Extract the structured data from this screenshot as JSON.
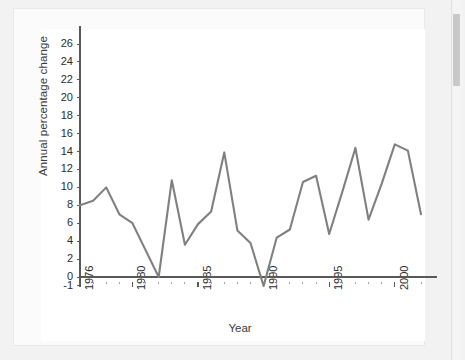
{
  "chart_data": {
    "type": "line",
    "title": "",
    "xlabel": "Year",
    "ylabel": "Annual percentage change",
    "xlim": [
      1976,
      2002
    ],
    "ylim": [
      -1,
      27
    ],
    "grid": false,
    "legend": "none",
    "line_color": "#808080",
    "axis_color": "#595959",
    "ytick_labels": [
      "26",
      "24",
      "22",
      "20",
      "18",
      "16",
      "14",
      "12",
      "10",
      "8",
      "6",
      "4",
      "2",
      "0",
      "-1"
    ],
    "ytick_values": [
      26,
      24,
      22,
      20,
      18,
      16,
      14,
      12,
      10,
      8,
      6,
      4,
      2,
      0,
      -1
    ],
    "xtick_labels": [
      "1976",
      "1980",
      "1985",
      "1990",
      "1995",
      "2000"
    ],
    "xtick_values": [
      1976,
      1980,
      1985,
      1990,
      1995,
      2000
    ],
    "x": [
      1976,
      1977,
      1978,
      1979,
      1980,
      1981,
      1982,
      1983,
      1984,
      1985,
      1986,
      1987,
      1988,
      1989,
      1990,
      1991,
      1992,
      1993,
      1994,
      1995,
      1996,
      1997,
      1998,
      1999,
      2000,
      2001,
      2002
    ],
    "values": [
      8.0,
      8.5,
      10.0,
      7.0,
      6.0,
      3.0,
      0.0,
      10.8,
      3.6,
      5.9,
      7.3,
      13.9,
      5.2,
      3.8,
      -1.0,
      4.4,
      5.3,
      10.6,
      11.3,
      4.8,
      9.5,
      14.4,
      6.4,
      10.4,
      14.8,
      14.1,
      7.0
    ],
    "series": [
      {
        "name": "Annual percentage change",
        "values": [
          8.0,
          8.5,
          10.0,
          7.0,
          6.0,
          3.0,
          0.0,
          10.8,
          3.6,
          5.9,
          7.3,
          13.9,
          5.2,
          3.8,
          -1.0,
          4.4,
          5.3,
          10.6,
          11.3,
          4.8,
          9.5,
          14.4,
          6.4,
          10.4,
          14.8,
          14.1,
          7.0
        ]
      }
    ]
  },
  "page": {
    "background_color": "#f2f2f2",
    "card_color": "#ffffff"
  }
}
